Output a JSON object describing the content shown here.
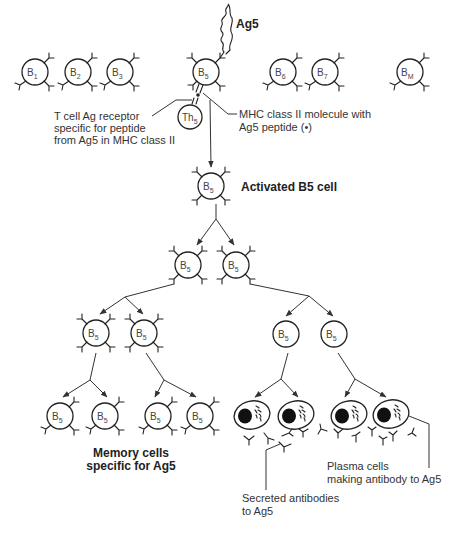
{
  "diagram": {
    "type": "clonal-selection-flowchart",
    "top_row_cells": [
      {
        "id": "B1",
        "label": "B",
        "sub": "1"
      },
      {
        "id": "B2",
        "label": "B",
        "sub": "2"
      },
      {
        "id": "B3",
        "label": "B",
        "sub": "3"
      },
      {
        "id": "B5",
        "label": "B",
        "sub": "5"
      },
      {
        "id": "B6",
        "label": "B",
        "sub": "6"
      },
      {
        "id": "B7",
        "label": "B",
        "sub": "7"
      },
      {
        "id": "BM",
        "label": "B",
        "sub": "M"
      }
    ],
    "antigen_label": "Ag5",
    "th_cell": {
      "label": "Th",
      "sub": "5"
    },
    "b5": {
      "label": "B",
      "sub": "5"
    },
    "annotations": {
      "tcr_line1": "T cell Ag receptor",
      "tcr_line2": "specific for peptide",
      "tcr_line3": "from Ag5 in MHC class II",
      "mhc_line1": "MHC class II molecule with",
      "mhc_line2": "Ag5 peptide (•)",
      "activated": "Activated B5 cell",
      "memory_line1": "Memory cells",
      "memory_line2": "specific for Ag5",
      "plasma_line1": "Plasma cells",
      "plasma_line2": "making antibody to Ag5",
      "secreted_line1": "Secreted antibodies",
      "secreted_line2": "to Ag5"
    },
    "nodes": [
      {
        "id": "activated-b5",
        "parent": "B5"
      },
      {
        "id": "gen2-left",
        "parent": "activated-b5"
      },
      {
        "id": "gen2-right",
        "parent": "activated-b5"
      },
      {
        "id": "gen3-memory-a",
        "parent": "gen2-left"
      },
      {
        "id": "gen3-memory-b",
        "parent": "gen2-left"
      },
      {
        "id": "gen3-plasma-precursor-a",
        "parent": "gen2-right"
      },
      {
        "id": "gen3-plasma-precursor-b",
        "parent": "gen2-right"
      },
      {
        "id": "memory-1",
        "parent": "gen3-memory-a"
      },
      {
        "id": "memory-2",
        "parent": "gen3-memory-a"
      },
      {
        "id": "memory-3",
        "parent": "gen3-memory-b"
      },
      {
        "id": "memory-4",
        "parent": "gen3-memory-b"
      },
      {
        "id": "plasma-1",
        "parent": "gen3-plasma-precursor-a"
      },
      {
        "id": "plasma-2",
        "parent": "gen3-plasma-precursor-a"
      },
      {
        "id": "plasma-3",
        "parent": "gen3-plasma-precursor-b"
      },
      {
        "id": "plasma-4",
        "parent": "gen3-plasma-precursor-b"
      }
    ]
  }
}
